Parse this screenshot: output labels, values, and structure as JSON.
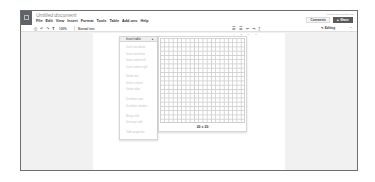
{
  "header": {
    "title": "Untitled document",
    "user_email": "person.user@gmail.com",
    "comments_label": "Comments",
    "share_label": "Share",
    "share_icon": "lock-icon"
  },
  "menubar": {
    "items": [
      "File",
      "Edit",
      "View",
      "Insert",
      "Format",
      "Tools",
      "Table",
      "Add-ons",
      "Help"
    ],
    "active": "Table"
  },
  "toolbar": {
    "icons": [
      "print-icon",
      "undo-icon",
      "redo-icon",
      "paint-format-icon"
    ],
    "zoom": "100%",
    "style": "Normal text",
    "right_icons": [
      "numbered-list-icon",
      "bulleted-list-icon",
      "decrease-indent-icon",
      "increase-indent-icon",
      "clear-formatting-icon"
    ],
    "editing_mode": "Editing",
    "collapse_icon": "chevron-up-icon"
  },
  "ruler": {
    "ticks": [
      "4",
      "5",
      "6",
      "7"
    ]
  },
  "table_menu": {
    "insert_table": "Insert table",
    "items": [
      {
        "label": "Insert row above",
        "enabled": false
      },
      {
        "label": "Insert row below",
        "enabled": false
      },
      {
        "label": "Insert column left",
        "enabled": false
      },
      {
        "label": "Insert column right",
        "enabled": false
      },
      {
        "label": "Delete row",
        "enabled": false
      },
      {
        "label": "Delete column",
        "enabled": false
      },
      {
        "label": "Delete table",
        "enabled": false
      },
      {
        "label": "Distribute rows",
        "enabled": false
      },
      {
        "label": "Distribute columns",
        "enabled": false
      },
      {
        "label": "Merge cells",
        "enabled": false
      },
      {
        "label": "Unmerge cells",
        "enabled": false
      },
      {
        "label": "Table properties",
        "enabled": false
      }
    ]
  },
  "grid_picker": {
    "rows": 20,
    "cols": 20,
    "size_label": "20 x 20"
  }
}
